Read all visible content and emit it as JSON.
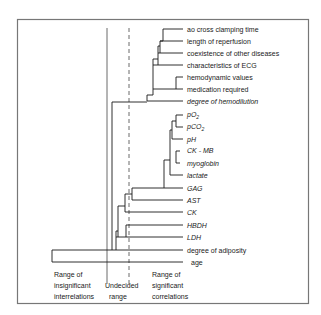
{
  "figure": {
    "type": "dendrogram",
    "colors": {
      "line": "#1a1a1a",
      "frame": "#777777",
      "background": "#ffffff"
    },
    "leaves": [
      {
        "label": "ao cross clamping time",
        "italic": false,
        "y": 29
      },
      {
        "label": "length of reperfusion",
        "italic": false,
        "y": 41
      },
      {
        "label": "coexistence of other diseases",
        "italic": false,
        "y": 53
      },
      {
        "label": "characteristics of ECG",
        "italic": false,
        "y": 65
      },
      {
        "label": "hemodynamic values",
        "italic": false,
        "y": 77
      },
      {
        "label": "medication required",
        "italic": false,
        "y": 89
      },
      {
        "label": "degree of hemodilution",
        "italic": true,
        "y": 101
      },
      {
        "label": "pO",
        "sub": "2",
        "italic": true,
        "y": 115
      },
      {
        "label": "pCO",
        "sub": "2",
        "italic": true,
        "y": 127
      },
      {
        "label": "pH",
        "italic": true,
        "y": 139
      },
      {
        "label": "CK - MB",
        "italic": true,
        "y": 151
      },
      {
        "label": "myoglobin",
        "italic": true,
        "y": 163
      },
      {
        "label": "lactate",
        "italic": true,
        "y": 175
      },
      {
        "label": "GAG",
        "italic": true,
        "y": 188
      },
      {
        "label": "AST",
        "italic": true,
        "y": 200
      },
      {
        "label": "CK",
        "italic": true,
        "y": 212
      },
      {
        "label": "HBDH",
        "italic": true,
        "y": 225
      },
      {
        "label": "LDH",
        "italic": true,
        "y": 237
      },
      {
        "label": "degree of adiposity",
        "italic": false,
        "y": 250
      },
      {
        "label": "age",
        "italic": false,
        "y": 262
      }
    ],
    "thresholds": [
      {
        "name": "insignificant-boundary",
        "style": "solid",
        "x": 107
      },
      {
        "name": "significant-boundary",
        "style": "dashed",
        "x": 129
      }
    ],
    "range_labels": [
      {
        "lines": [
          "Range of",
          "insignificant",
          "interrelations"
        ],
        "x": 54
      },
      {
        "lines": [
          "Undecided",
          "range"
        ],
        "x": 105
      },
      {
        "lines": [
          "Range of",
          "significant",
          "correlations"
        ],
        "x": 152
      }
    ]
  }
}
